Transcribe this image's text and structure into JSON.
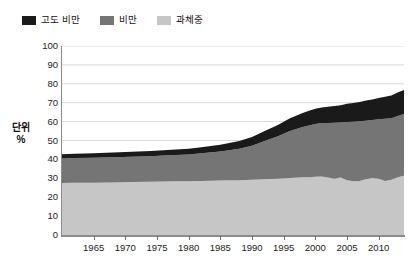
{
  "chart_data": {
    "type": "area",
    "title": "",
    "subtitle": "",
    "xlabel": "",
    "ylabel": "단위\n%",
    "unit_label_lines": [
      "단위",
      "%"
    ],
    "stacked": true,
    "grid": true,
    "grid_axis": "y",
    "legend_position": "top-left",
    "xlim": [
      1960,
      2014
    ],
    "ylim": [
      0,
      100
    ],
    "y_ticks": [
      0,
      10,
      20,
      30,
      40,
      50,
      60,
      70,
      80,
      90,
      100
    ],
    "x_ticks": [
      1965,
      1970,
      1975,
      1980,
      1985,
      1990,
      1995,
      2000,
      2005,
      2010
    ],
    "x": [
      1960,
      1962,
      1965,
      1968,
      1971,
      1974,
      1976,
      1978,
      1980,
      1982,
      1985,
      1988,
      1990,
      1992,
      1994,
      1996,
      1998,
      1999,
      2000,
      2001,
      2002,
      2003,
      2004,
      2005,
      2006,
      2007,
      2008,
      2009,
      2010,
      2011,
      2012,
      2013,
      2014
    ],
    "series": [
      {
        "name": "과체중",
        "color": "#c6c6c6",
        "values": [
          27.5,
          27.6,
          27.7,
          27.8,
          28.0,
          28.2,
          28.3,
          28.4,
          28.5,
          28.6,
          28.8,
          29.0,
          29.2,
          29.5,
          29.8,
          30.2,
          30.5,
          30.6,
          30.8,
          31.0,
          30.4,
          29.7,
          30.4,
          29.0,
          28.5,
          28.6,
          29.5,
          30.2,
          29.8,
          28.6,
          29.2,
          30.6,
          31.4
        ]
      },
      {
        "name": "비만",
        "color": "#757575",
        "values": [
          13.0,
          13.1,
          13.2,
          13.3,
          13.4,
          13.5,
          13.7,
          13.9,
          14.1,
          14.6,
          15.4,
          16.6,
          18.0,
          20.2,
          22.3,
          24.8,
          26.6,
          27.3,
          27.9,
          28.2,
          28.8,
          29.7,
          29.1,
          30.8,
          31.4,
          31.6,
          31.0,
          30.6,
          31.4,
          32.9,
          32.6,
          32.4,
          32.6
        ]
      },
      {
        "name": "고도 비만",
        "color": "#1a1a1a",
        "values": [
          2.2,
          2.3,
          2.4,
          2.5,
          2.6,
          2.7,
          2.8,
          2.9,
          3.0,
          3.2,
          3.6,
          4.1,
          4.6,
          5.3,
          6.0,
          6.8,
          7.5,
          7.8,
          8.1,
          8.3,
          8.6,
          8.9,
          9.2,
          9.6,
          9.9,
          10.2,
          10.6,
          10.9,
          11.3,
          11.7,
          12.0,
          12.4,
          12.7
        ]
      }
    ],
    "totals": [
      42.7,
      43.0,
      43.3,
      43.6,
      44.0,
      44.4,
      44.8,
      45.2,
      45.6,
      46.4,
      47.8,
      49.7,
      51.8,
      55.0,
      58.1,
      61.8,
      64.6,
      65.7,
      66.8,
      67.5,
      67.8,
      68.3,
      68.7,
      69.4,
      69.8,
      70.4,
      71.1,
      71.7,
      72.5,
      73.2,
      73.8,
      75.4,
      76.7
    ]
  },
  "legend": {
    "items": [
      {
        "label": "고도 비만",
        "color": "#1a1a1a"
      },
      {
        "label": "비만",
        "color": "#757575"
      },
      {
        "label": "과체중",
        "color": "#c6c6c6"
      }
    ]
  },
  "axes": {
    "y": {
      "labels": [
        "100",
        "90",
        "80",
        "70",
        "60",
        "50",
        "40",
        "30",
        "20",
        "10",
        "0"
      ],
      "unit": [
        "단위",
        "%"
      ]
    },
    "x": {
      "labels": [
        "1965",
        "1970",
        "1975",
        "1980",
        "1985",
        "1990",
        "1995",
        "2000",
        "2005",
        "2010"
      ]
    }
  },
  "colors": {
    "severe_obesity": "#1a1a1a",
    "obesity": "#757575",
    "overweight": "#c6c6c6",
    "grid": "#d9d9d9",
    "axis": "#8c8c8c",
    "background": "#ffffff"
  }
}
